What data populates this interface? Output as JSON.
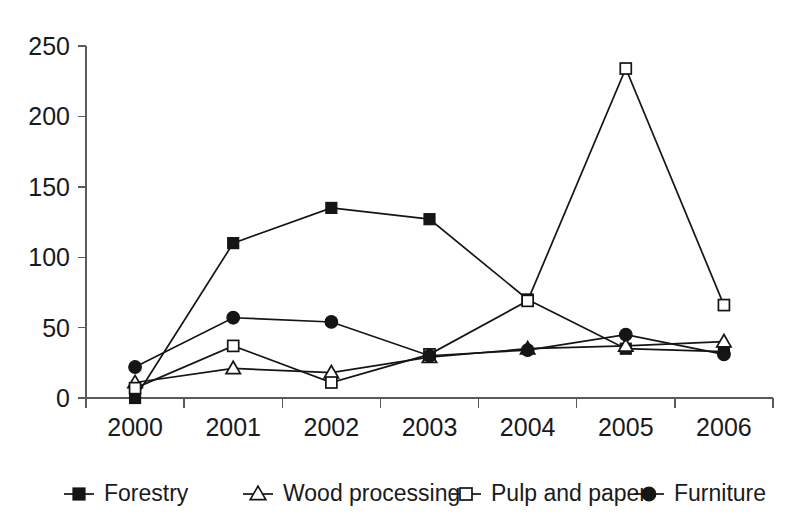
{
  "chart_data": {
    "type": "line",
    "title": "",
    "subtitle": "",
    "xlabel": "",
    "ylabel": "",
    "categories": [
      "2000",
      "2001",
      "2002",
      "2003",
      "2004",
      "2005",
      "2006"
    ],
    "x": [
      2000,
      2001,
      2002,
      2003,
      2004,
      2005,
      2006
    ],
    "ylim": [
      0,
      250
    ],
    "yticks": [
      0,
      50,
      100,
      150,
      200,
      250
    ],
    "ytick_labels": [
      "0",
      "50",
      "100",
      "150",
      "200",
      "250"
    ],
    "grid": false,
    "legend_position": "bottom",
    "series": [
      {
        "name": "Forestry",
        "marker": "filled-square",
        "color": "#151515",
        "values": [
          0,
          110,
          135,
          127,
          70,
          35,
          33
        ]
      },
      {
        "name": "Wood processing",
        "marker": "open-triangle",
        "color": "#151515",
        "values": [
          11,
          21,
          18,
          29,
          35,
          37,
          40
        ]
      },
      {
        "name": "Pulp and paper",
        "marker": "open-square",
        "color": "#151515",
        "values": [
          7,
          37,
          11,
          31,
          69,
          234,
          66
        ]
      },
      {
        "name": "Furniture",
        "marker": "filled-circle",
        "color": "#151515",
        "values": [
          22,
          57,
          54,
          30,
          34,
          45,
          31
        ]
      }
    ]
  },
  "axes": {
    "y_tick_labels": [
      "250",
      "200",
      "150",
      "100",
      "50",
      "0"
    ],
    "x_tick_labels": [
      "2000",
      "2001",
      "2002",
      "2003",
      "2004",
      "2005",
      "2006"
    ]
  },
  "legend": {
    "items": [
      {
        "label": "Forestry",
        "marker": "filled-square"
      },
      {
        "label": "Wood processing",
        "marker": "open-triangle"
      },
      {
        "label": "Pulp and paper",
        "marker": "open-square"
      },
      {
        "label": "Furniture",
        "marker": "filled-circle"
      }
    ]
  }
}
